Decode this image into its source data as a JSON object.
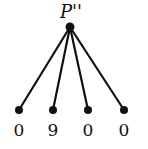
{
  "diagram": {
    "type": "tree",
    "root": {
      "label": "P''",
      "x": 70,
      "y": 27
    },
    "children": [
      {
        "label": "0",
        "x": 19,
        "y": 110
      },
      {
        "label": "9",
        "x": 53,
        "y": 110
      },
      {
        "label": "0",
        "x": 88,
        "y": 110
      },
      {
        "label": "0",
        "x": 124,
        "y": 110
      }
    ],
    "colors": {
      "line": "#111111",
      "node": "#111111",
      "background": "#ffffff"
    }
  }
}
